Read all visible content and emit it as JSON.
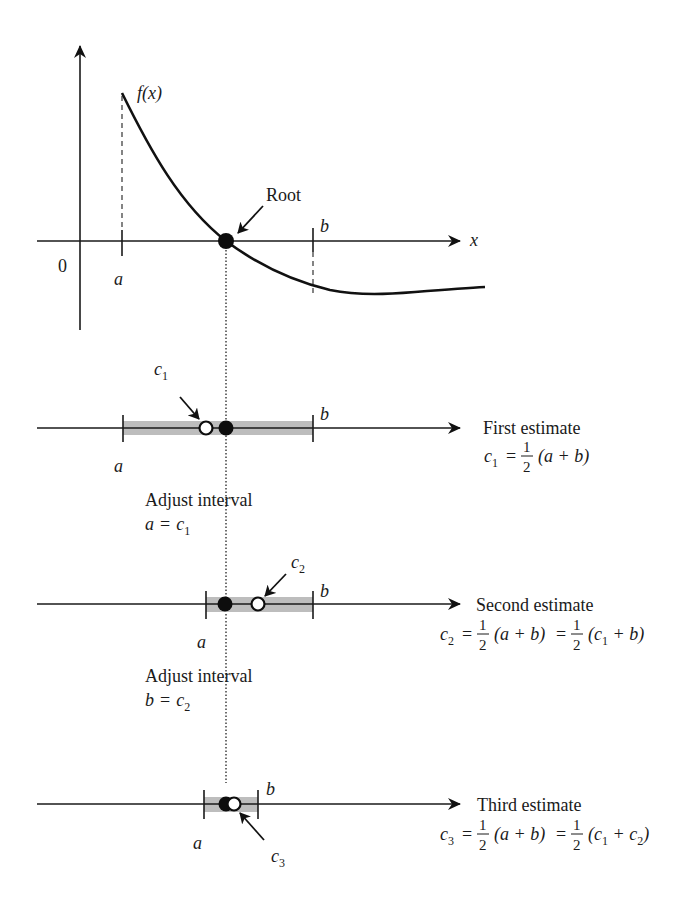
{
  "figure": {
    "top_graph": {
      "function_label": "f(x)",
      "x_axis_label": "x",
      "origin_label": "0",
      "a_label": "a",
      "b_label": "b",
      "root_label": "Root"
    },
    "steps": [
      {
        "name": "first",
        "estimate_label": "c",
        "estimate_sub": "1",
        "a_label": "a",
        "b_label": "b",
        "title": "First estimate",
        "formula": {
          "lhs": "c",
          "lhs_sub": "1",
          "eq": "=",
          "frac_num": "1",
          "frac_den": "2",
          "expr": "(a + b)"
        },
        "adjust_title": "Adjust interval",
        "adjust_lhs": "a",
        "adjust_eq": "=",
        "adjust_rhs": "c",
        "adjust_rhs_sub": "1"
      },
      {
        "name": "second",
        "estimate_label": "c",
        "estimate_sub": "2",
        "a_label": "a",
        "b_label": "b",
        "title": "Second estimate",
        "formula": {
          "lhs": "c",
          "lhs_sub": "2",
          "eq": "=",
          "frac_num": "1",
          "frac_den": "2",
          "expr": "(a + b)",
          "eq2": "=",
          "frac2_num": "1",
          "frac2_den": "2",
          "expr2_open": "(c",
          "expr2_sub1": "1",
          "expr2_rest": " + b)"
        },
        "adjust_title": "Adjust interval",
        "adjust_lhs": "b",
        "adjust_eq": "=",
        "adjust_rhs": "c",
        "adjust_rhs_sub": "2"
      },
      {
        "name": "third",
        "estimate_label": "c",
        "estimate_sub": "3",
        "a_label": "a",
        "b_label": "b",
        "title": "Third estimate",
        "formula": {
          "lhs": "c",
          "lhs_sub": "3",
          "eq": "=",
          "frac_num": "1",
          "frac_den": "2",
          "expr": "(a + b)",
          "eq2": "=",
          "frac2_num": "1",
          "frac2_den": "2",
          "expr2_open": "(c",
          "expr2_sub1": "1",
          "expr2_mid": " + c",
          "expr2_sub2": "2",
          "expr2_close": ")"
        }
      }
    ]
  }
}
